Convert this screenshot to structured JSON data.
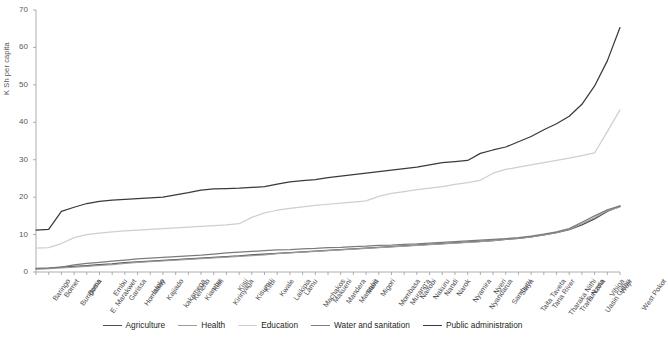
{
  "chart_data": {
    "type": "line",
    "title": "",
    "xlabel": "",
    "ylabel": "K Sh per capita",
    "ylim": [
      0,
      70
    ],
    "yticks": [
      0,
      10,
      20,
      30,
      40,
      50,
      60,
      70
    ],
    "grid": false,
    "legend_position": "bottom",
    "categories": [
      "Baringo",
      "Bomet",
      "Bungoma",
      "Busia",
      "E. Marakwet",
      "Embu",
      "Garissa",
      "Homabay",
      "Isiolo",
      "Kajiado",
      "kakamega",
      "Kericho",
      "Kiambu",
      "Kilifi",
      "Kirinyaga",
      "Kisii",
      "Kisumu",
      "Kitui",
      "Kwale",
      "Laikipia",
      "Lamu",
      "Machakos",
      "Makueni",
      "Mandera",
      "Marsabit",
      "Meru",
      "Migori",
      "Mombasa",
      "Murang'a",
      "Nairobi",
      "Nakuru",
      "Nandi",
      "Narok",
      "Nyamira",
      "Nyandarua",
      "Nyeri",
      "Samburu",
      "Siaya",
      "Taita Taveta",
      "Tana River",
      "Tharaka Nithi",
      "Trans Nzoia",
      "Turkana",
      "Uasin Gishu",
      "Vihiga",
      "Wajir",
      "West Pokot"
    ],
    "series": [
      {
        "name": "Agriculture",
        "color": "#4d4d4f",
        "values": [
          0.9,
          1.0,
          1.3,
          1.5,
          1.7,
          2.0,
          2.2,
          2.5,
          2.7,
          2.9,
          3.1,
          3.3,
          3.5,
          3.7,
          3.9,
          4.1,
          4.3,
          4.6,
          4.8,
          5.0,
          5.2,
          5.4,
          5.6,
          5.8,
          6.0,
          6.2,
          6.4,
          6.6,
          6.8,
          7.0,
          7.2,
          7.4,
          7.6,
          7.8,
          8.0,
          8.2,
          8.4,
          8.7,
          9.0,
          9.4,
          9.9,
          10.5,
          11.3,
          12.6,
          14.2,
          16.2,
          17.6
        ]
      },
      {
        "name": "Health",
        "color": "#9b9b9d",
        "values": [
          0.8,
          0.9,
          1.1,
          1.3,
          1.5,
          1.8,
          2.0,
          2.3,
          2.6,
          2.8,
          3.0,
          3.2,
          3.4,
          3.6,
          3.8,
          4.0,
          4.2,
          4.4,
          4.6,
          4.9,
          5.1,
          5.3,
          5.5,
          5.7,
          5.9,
          6.1,
          6.3,
          6.5,
          6.7,
          6.9,
          7.1,
          7.3,
          7.5,
          7.7,
          7.9,
          8.1,
          8.4,
          8.7,
          9.0,
          9.4,
          9.9,
          10.5,
          11.4,
          12.9,
          14.5,
          16.3,
          17.4
        ]
      },
      {
        "name": "Education",
        "color": "#cfcfd1",
        "values": [
          6.4,
          6.5,
          7.6,
          9.2,
          10.0,
          10.4,
          10.7,
          11.0,
          11.2,
          11.4,
          11.6,
          11.8,
          12.0,
          12.2,
          12.4,
          12.6,
          12.9,
          14.6,
          15.8,
          16.5,
          17.0,
          17.4,
          17.8,
          18.1,
          18.4,
          18.7,
          19.0,
          20.2,
          21.0,
          21.5,
          22.0,
          22.4,
          22.8,
          23.4,
          23.9,
          24.5,
          26.4,
          27.4,
          28.0,
          28.6,
          29.2,
          29.8,
          30.4,
          31.1,
          31.8,
          37.5,
          43.3
        ]
      },
      {
        "name": "Water and sanitation",
        "color": "#7b7b7d",
        "values": [
          1.0,
          1.1,
          1.3,
          1.9,
          2.3,
          2.6,
          2.9,
          3.2,
          3.5,
          3.7,
          3.9,
          4.1,
          4.3,
          4.5,
          4.8,
          5.1,
          5.3,
          5.5,
          5.7,
          5.9,
          6.0,
          6.2,
          6.3,
          6.5,
          6.6,
          6.8,
          6.9,
          7.1,
          7.2,
          7.4,
          7.5,
          7.7,
          7.9,
          8.1,
          8.3,
          8.5,
          8.7,
          8.9,
          9.2,
          9.6,
          10.1,
          10.7,
          11.6,
          13.3,
          15.0,
          16.6,
          17.7
        ]
      },
      {
        "name": "Public administration",
        "color": "#3a3a3c",
        "values": [
          11.2,
          11.4,
          16.2,
          17.3,
          18.3,
          18.9,
          19.2,
          19.4,
          19.6,
          19.8,
          20.0,
          20.6,
          21.2,
          21.9,
          22.2,
          22.3,
          22.4,
          22.6,
          22.8,
          23.5,
          24.1,
          24.4,
          24.7,
          25.2,
          25.6,
          26.0,
          26.4,
          26.8,
          27.2,
          27.6,
          28.0,
          28.6,
          29.2,
          29.5,
          29.8,
          31.7,
          32.6,
          33.4,
          34.8,
          36.2,
          38.0,
          39.6,
          41.6,
          44.8,
          49.7,
          56.4,
          65.3
        ]
      }
    ]
  },
  "legend": {
    "items": [
      {
        "label": "Agriculture"
      },
      {
        "label": "Health"
      },
      {
        "label": "Education"
      },
      {
        "label": "Water and sanitation"
      },
      {
        "label": "Public administration"
      }
    ]
  }
}
